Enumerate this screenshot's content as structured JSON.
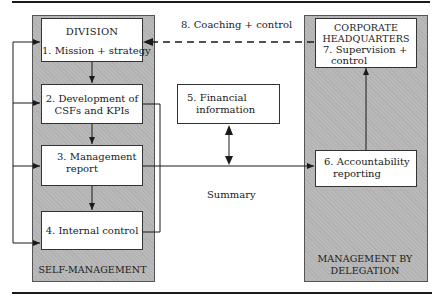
{
  "diagram": {
    "left_panel": {
      "title": "DIVISION",
      "footer": "SELF-MANAGEMENT",
      "boxes": [
        {
          "label_line1": "1. Mission + strategy"
        },
        {
          "label_line1": "2. Development of",
          "label_line2": "CSFs and KPIs"
        },
        {
          "label_line1": "3. Management",
          "label_line2": "report"
        },
        {
          "label_line1": "4. Internal control"
        }
      ]
    },
    "middle": {
      "box5_line1": "5. Financial",
      "box5_line2": "information",
      "summary_label": "Summary",
      "coaching_label": "8. Coaching + control"
    },
    "right_panel": {
      "title_line1": "CORPORATE",
      "title_line2": "HEADQUARTERS",
      "box7_line1": "7. Supervision +",
      "box7_line2": "control",
      "box6_line1": "6. Accountability",
      "box6_line2": "reporting",
      "footer_line1": "MANAGEMENT BY",
      "footer_line2": "DELEGATION"
    },
    "colors": {
      "panel": "#b9b9b9",
      "box": "#ffffff",
      "line": "#1a1a1a"
    }
  }
}
